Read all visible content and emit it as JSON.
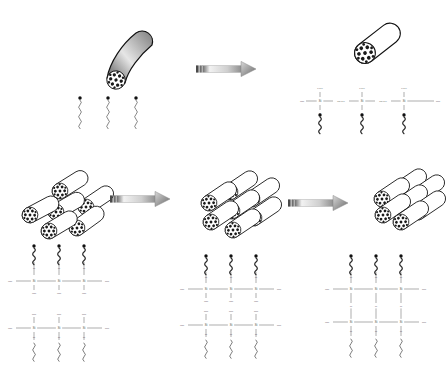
{
  "figure": {
    "background_color": "#ffffff",
    "ink_color": "#111111",
    "rows": 2,
    "steps": 4
  },
  "chem": {
    "si": "Si",
    "o": "O",
    "oh": "OH",
    "ho": "HO",
    "ch3": "CH3",
    "och3": "OCH3",
    "ho_och3": "HO",
    "link_och3": "CH3O"
  },
  "panels": [
    {
      "id": "panel-top-left",
      "name": "pristine-nanotube-with-free-silanes",
      "tube_style": "bent-gradient",
      "tube_count": 1,
      "surfactant_count": 3,
      "chem_structure": "none"
    },
    {
      "id": "panel-top-right",
      "name": "silane-grafted-single-nanotube",
      "tube_style": "straight-open",
      "tube_count": 1,
      "surfactant_count": 3,
      "chem_structure": "linear-siloxane-chain",
      "si_centers": 3
    },
    {
      "id": "panel-bottom-left",
      "name": "loose-nanotube-bundle",
      "tube_style": "loose-bundle",
      "tube_count": 6,
      "chem_structure": "two-parallel-silanol-chains",
      "si_centers": 6
    },
    {
      "id": "panel-bottom-middle",
      "name": "aligned-nanotube-bundle",
      "tube_style": "aligned-bundle",
      "tube_count": 7,
      "chem_structure": "two-silanol-chains-facing",
      "si_centers": 6
    },
    {
      "id": "panel-bottom-right",
      "name": "condensed-nanotube-bundle",
      "tube_style": "packed-bundle",
      "tube_count": 7,
      "chem_structure": "crosslinked-siloxane-network",
      "si_centers": 6
    }
  ],
  "arrows": [
    {
      "id": "arrow-1",
      "name": "reaction-arrow-top",
      "direction": "right"
    },
    {
      "id": "arrow-2",
      "name": "reaction-arrow-bottom-1",
      "direction": "right"
    },
    {
      "id": "arrow-3",
      "name": "reaction-arrow-bottom-2",
      "direction": "right"
    }
  ],
  "legend": {
    "surfactant": "alkyl-chain-molecule",
    "nanotube_face": "packed-tube-cross-section"
  }
}
